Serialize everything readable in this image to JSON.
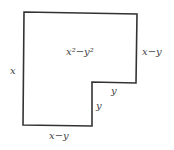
{
  "diagram": {
    "shape": {
      "points": [
        [
          24,
          12
        ],
        [
          137,
          14
        ],
        [
          136,
          83
        ],
        [
          92,
          82
        ],
        [
          92,
          126
        ],
        [
          23,
          125
        ]
      ],
      "stroke": "#333333",
      "fill": "#ffffff"
    },
    "labels": {
      "area": "x²−y²",
      "left_side": "x",
      "right_side": "x−y",
      "step_horizontal": "y",
      "step_vertical": "y",
      "bottom_side": "x−y"
    }
  }
}
